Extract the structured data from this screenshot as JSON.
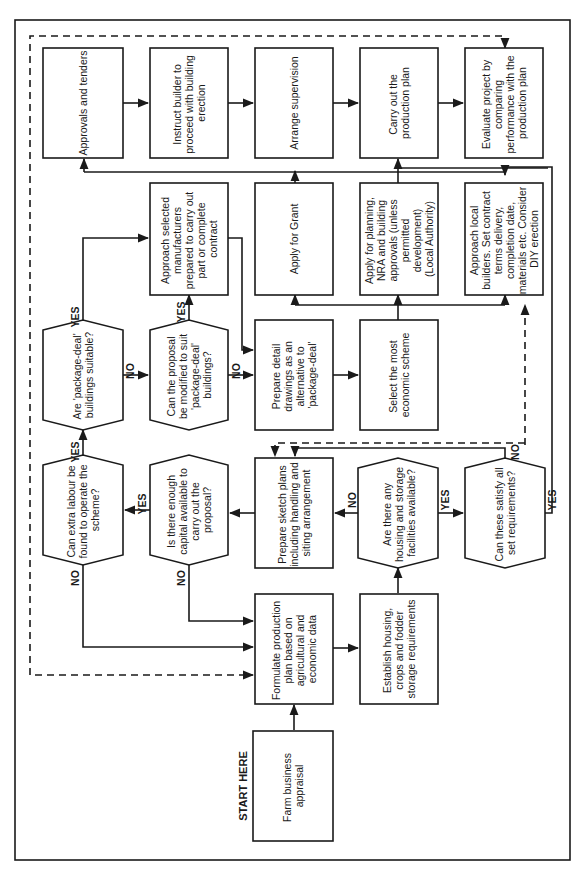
{
  "diagram": {
    "orientation": "rotated 90 degrees counter-clockwise (text reads bottom-to-top)",
    "start_label": "START HERE",
    "nodes": {
      "farm_appraisal": {
        "type": "process",
        "lines": [
          "Farm business",
          "appraisal"
        ]
      },
      "formulate_plan": {
        "type": "process",
        "lines": [
          "Formulate production",
          "plan based on",
          "agricultural and",
          "economic data"
        ]
      },
      "establish_housing": {
        "type": "process",
        "lines": [
          "Establish housing,",
          "crops and fodder",
          "storage requirements"
        ]
      },
      "q_housing_available": {
        "type": "decision",
        "lines": [
          "Are there any",
          "housing and storage",
          "facilities available?"
        ]
      },
      "q_satisfy_requirements": {
        "type": "decision",
        "lines": [
          "Can these satisfy all",
          "set requirements?"
        ]
      },
      "sketch_plans": {
        "type": "process",
        "lines": [
          "Prepare sketch plans",
          "including handling and",
          "siting arrangement"
        ]
      },
      "q_capital": {
        "type": "decision",
        "lines": [
          "Is there enough",
          "capital available to",
          "carry out the",
          "proposal?"
        ]
      },
      "q_labour": {
        "type": "decision",
        "lines": [
          "Can extra labour be",
          "found to operate the",
          "scheme?"
        ]
      },
      "q_package_deal": {
        "type": "decision",
        "lines": [
          "Are 'package-deal'",
          "buildings suitable?"
        ]
      },
      "q_modify_proposal": {
        "type": "decision",
        "lines": [
          "Can the proposal",
          "be modified to suit",
          "'package-deal'",
          "buildings?"
        ]
      },
      "approach_manufacturers": {
        "type": "process",
        "lines": [
          "Approach selected",
          "manufacturers",
          "prepared to carry out",
          "part or complete",
          "contract"
        ]
      },
      "detail_drawings": {
        "type": "process",
        "lines": [
          "Prepare detail",
          "drawings as an",
          "alternative to",
          "'package-deal'"
        ]
      },
      "select_scheme": {
        "type": "process",
        "lines": [
          "Select the most",
          "economic scheme"
        ]
      },
      "apply_grant": {
        "type": "process",
        "lines": [
          "Apply for Grant"
        ]
      },
      "apply_planning": {
        "type": "process",
        "lines": [
          "Apply for planning,",
          "NRA and building",
          "approvals (unless",
          "permitted",
          "development)",
          "(Local Authority)"
        ]
      },
      "approach_builders": {
        "type": "process",
        "lines": [
          "Approach local",
          "builders. Set contract",
          "terms delivery,",
          "completion date,",
          "materials etc. Consider",
          "DIY erection"
        ]
      },
      "approvals_tenders": {
        "type": "process",
        "lines": [
          "Approvals and tenders"
        ]
      },
      "instruct_builder": {
        "type": "process",
        "lines": [
          "Instruct builder to",
          "proceed with building",
          "erection"
        ]
      },
      "arrange_supervision": {
        "type": "process",
        "lines": [
          "Arrange supervision"
        ]
      },
      "carry_out_plan": {
        "type": "process",
        "lines": [
          "Carry out the",
          "production plan"
        ]
      },
      "evaluate_project": {
        "type": "process",
        "lines": [
          "Evaluate project by",
          "comparing",
          "performance with the",
          "production plan"
        ]
      }
    },
    "edge_labels": {
      "yes": "YES",
      "no": "NO"
    },
    "edges": [
      {
        "from": "farm_appraisal",
        "to": "formulate_plan"
      },
      {
        "from": "formulate_plan",
        "to": "establish_housing"
      },
      {
        "from": "establish_housing",
        "to": "q_housing_available"
      },
      {
        "from": "q_housing_available",
        "to": "q_satisfy_requirements",
        "label": "YES"
      },
      {
        "from": "q_housing_available",
        "to": "sketch_plans",
        "label": "NO"
      },
      {
        "from": "q_satisfy_requirements",
        "to": "sketch_plans",
        "label": "NO"
      },
      {
        "from": "q_satisfy_requirements",
        "to": "approach_builders",
        "label": "YES"
      },
      {
        "from": "sketch_plans",
        "to": "q_capital"
      },
      {
        "from": "q_capital",
        "to": "q_labour",
        "label": "YES"
      },
      {
        "from": "q_capital",
        "to": "formulate_plan",
        "label": "NO"
      },
      {
        "from": "q_labour",
        "to": "q_package_deal",
        "label": "YES"
      },
      {
        "from": "q_labour",
        "to": "formulate_plan",
        "label": "NO"
      },
      {
        "from": "q_package_deal",
        "to": "approach_manufacturers",
        "label": "YES"
      },
      {
        "from": "q_package_deal",
        "to": "q_modify_proposal",
        "label": "NO"
      },
      {
        "from": "q_modify_proposal",
        "to": "approach_manufacturers",
        "label": "YES"
      },
      {
        "from": "q_modify_proposal",
        "to": "detail_drawings",
        "label": "NO"
      },
      {
        "from": "approach_manufacturers",
        "to": "detail_drawings"
      },
      {
        "from": "detail_drawings",
        "to": "select_scheme"
      },
      {
        "from": "select_scheme",
        "to": "apply_grant"
      },
      {
        "from": "select_scheme",
        "to": "apply_planning"
      },
      {
        "from": "select_scheme",
        "to": "approach_builders"
      },
      {
        "from": "apply_grant",
        "to": "approvals_tenders"
      },
      {
        "from": "apply_planning",
        "to": "carry_out_plan"
      },
      {
        "from": "approach_builders",
        "to": "approvals_tenders"
      },
      {
        "from": "approvals_tenders",
        "to": "instruct_builder"
      },
      {
        "from": "instruct_builder",
        "to": "arrange_supervision"
      },
      {
        "from": "arrange_supervision",
        "to": "carry_out_plan"
      },
      {
        "from": "carry_out_plan",
        "to": "evaluate_project"
      },
      {
        "from": "evaluate_project",
        "to": "formulate_plan",
        "style": "dashed"
      },
      {
        "from": "q_satisfy_requirements",
        "to": "approach_builders",
        "style": "dashed"
      },
      {
        "from": "q_satisfy_requirements",
        "to": "sketch_plans",
        "style": "dashed"
      }
    ]
  }
}
